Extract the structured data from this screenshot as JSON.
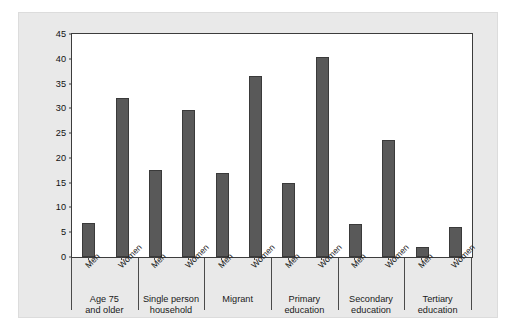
{
  "chart_data": {
    "type": "bar",
    "title": "",
    "subtitle": "",
    "xlabel": "",
    "ylabel": "Share of elderly at risk of relative poverty (%)",
    "ylim": [
      0,
      45
    ],
    "yticks": [
      0,
      5,
      10,
      15,
      20,
      25,
      30,
      35,
      40,
      45
    ],
    "grid": false,
    "legend": "none",
    "bar_color": "#595959",
    "panel_background": "#ffffff",
    "figure_background": "#e9e9e9",
    "categories": [
      "Men",
      "Women"
    ],
    "groups": [
      {
        "label_line1": "Age 75",
        "label_line2": "and older",
        "bars": [
          {
            "category": "Men",
            "value": 6.9
          },
          {
            "category": "Women",
            "value": 32.0
          }
        ]
      },
      {
        "label_line1": "Single person",
        "label_line2": "household",
        "bars": [
          {
            "category": "Men",
            "value": 17.5
          },
          {
            "category": "Women",
            "value": 29.7
          }
        ]
      },
      {
        "label_line1": "Migrant",
        "label_line2": "",
        "bars": [
          {
            "category": "Men",
            "value": 17.0
          },
          {
            "category": "Women",
            "value": 36.6
          }
        ]
      },
      {
        "label_line1": "Primary",
        "label_line2": "education",
        "bars": [
          {
            "category": "Men",
            "value": 15.0
          },
          {
            "category": "Women",
            "value": 40.4
          }
        ]
      },
      {
        "label_line1": "Secondary",
        "label_line2": "education",
        "bars": [
          {
            "category": "Men",
            "value": 6.7
          },
          {
            "category": "Women",
            "value": 23.6
          }
        ]
      },
      {
        "label_line1": "Tertiary",
        "label_line2": "education",
        "bars": [
          {
            "category": "Men",
            "value": 2.1
          },
          {
            "category": "Women",
            "value": 6.0
          }
        ]
      }
    ]
  }
}
